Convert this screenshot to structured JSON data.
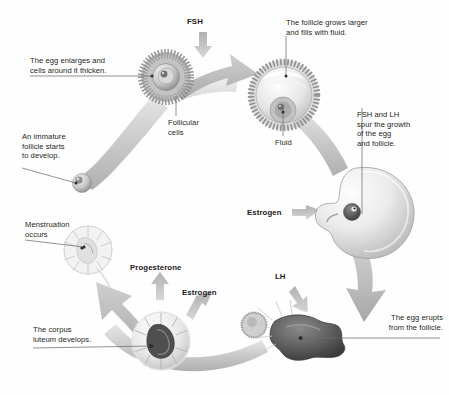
{
  "figure": {
    "background_color": "#fefefe",
    "text_color": "#231f20",
    "arrow_color": "#b5b5b5",
    "structure_color": "#d0d0d0"
  },
  "callouts": [
    {
      "id": "egg-enlarges",
      "text": "The egg enlarges and\ncells around it thicken.",
      "align": "left"
    },
    {
      "id": "follicular-cells",
      "text": "Follicular\ncells",
      "align": "left"
    },
    {
      "id": "immature",
      "text": "An immature\nfollicle starts\nto develop.",
      "align": "left"
    },
    {
      "id": "grows-larger",
      "text": "The follicle grows larger\nand fills with fluid.",
      "align": "left"
    },
    {
      "id": "fluid",
      "text": "Fluid",
      "align": "left"
    },
    {
      "id": "fsh-lh-spur",
      "text": "FSH and LH\nspur the growth\nof the egg\nand follicle.",
      "align": "left"
    },
    {
      "id": "egg-erupts",
      "text": "The egg erupts\nfrom the follicle.",
      "align": "right"
    },
    {
      "id": "corpus-luteum",
      "text": "The corpus\nluteum develops.",
      "align": "left"
    },
    {
      "id": "menstruation",
      "text": "Menstruation\noccurs",
      "align": "left"
    }
  ],
  "hormones": [
    {
      "id": "fsh",
      "text": "FSH"
    },
    {
      "id": "estrogen-right",
      "text": "Estrogen"
    },
    {
      "id": "lh",
      "text": "LH"
    },
    {
      "id": "estrogen-mid",
      "text": "Estrogen"
    },
    {
      "id": "progesterone",
      "text": "Progesterone"
    }
  ],
  "stages": [
    {
      "id": "primordial-follicle",
      "name": "immature follicle"
    },
    {
      "id": "primary-follicle",
      "name": "follicle with thickened follicular cells"
    },
    {
      "id": "antral-follicle",
      "name": "follicle filled with fluid"
    },
    {
      "id": "mature-follicle",
      "name": "mature graafian follicle"
    },
    {
      "id": "ruptured-follicle",
      "name": "ruptured follicle releasing egg"
    },
    {
      "id": "corpus-luteum-body",
      "name": "corpus luteum"
    },
    {
      "id": "degenerating-body",
      "name": "degenerating corpus luteum"
    },
    {
      "id": "released-egg",
      "name": "released ovum"
    }
  ]
}
